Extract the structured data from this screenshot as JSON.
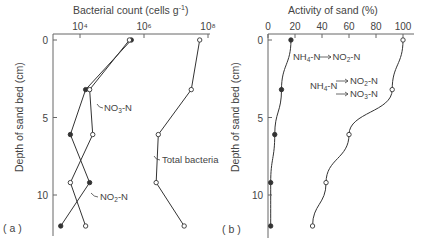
{
  "chart_data": [
    {
      "panel": "(a)",
      "type": "line",
      "title": "",
      "xlabel": "Bacterial count (cells g⁻¹)",
      "ylabel": "Depth of sand bed (cm)",
      "xscale": "log",
      "xlim": [
        3000,
        100000000
      ],
      "ylim": [
        0,
        12.5
      ],
      "y_inverted": true,
      "x_axis_position": "top",
      "x_ticks": [
        10000,
        1000000,
        100000000
      ],
      "x_tick_labels": [
        "10⁴",
        "10⁶",
        "10⁸"
      ],
      "y_ticks": [
        0,
        5,
        10
      ],
      "y_tick_labels": [
        "0",
        "5",
        "10"
      ],
      "grid": false,
      "legend": "inline labels",
      "depths": [
        0,
        3.2,
        6.1,
        9.2,
        12
      ],
      "series": [
        {
          "name": "NO₃-N",
          "marker": "filled",
          "values": [
            400000,
            15000,
            5000,
            20000,
            2500
          ]
        },
        {
          "name": "NO₂-N",
          "marker": "open",
          "values": [
            350000,
            20000,
            25000,
            5000,
            15000
          ]
        },
        {
          "name": "Total bacteria",
          "marker": "open",
          "values": [
            55000000,
            30000000,
            2800000,
            2400000,
            18000000
          ]
        }
      ],
      "annotations": [
        "NO₃-N",
        "NO₂-N",
        "Total bacteria"
      ]
    },
    {
      "panel": "(b)",
      "type": "line",
      "title": "",
      "xlabel": "Activity of sand (%)",
      "ylabel": "Depth of sand bed (cm)",
      "xlim": [
        0,
        105
      ],
      "ylim": [
        0,
        12.5
      ],
      "y_inverted": true,
      "x_axis_position": "top",
      "x_ticks": [
        0,
        20,
        40,
        60,
        80,
        100
      ],
      "x_tick_labels": [
        "0",
        "20",
        "40",
        "60",
        "80",
        "100"
      ],
      "y_ticks": [
        0,
        5,
        10
      ],
      "y_tick_labels": [
        "0",
        "5",
        "10"
      ],
      "grid": false,
      "legend": "inline labels",
      "depths": [
        0,
        3.2,
        6.1,
        9.2,
        12
      ],
      "series": [
        {
          "name": "NH₄-N → NO₂-N",
          "marker": "filled",
          "values": [
            17,
            10,
            5,
            2,
            2
          ]
        },
        {
          "name": "NH₄-N → NO₂-N → NO₃-N",
          "marker": "open",
          "values": [
            100,
            92,
            60,
            43,
            33
          ]
        }
      ],
      "annotations": [
        "NH₄-N → NO₂-N",
        "NH₄-N → NO₂-N / → NO₃-N"
      ]
    }
  ],
  "labels": {
    "a_title": "Bacterial count (cells g",
    "a_title_sup": "-1",
    "a_title_end": ")",
    "a_panel": "( a )",
    "b_title": "Activity of sand  (%)",
    "b_panel": "( b )",
    "ylabel": "Depth of sand bed (cm)",
    "a_ann_no3": "NO",
    "a_ann_no3_sub": "3",
    "a_ann_no3_end": "-N",
    "a_ann_no2": "NO",
    "a_ann_no2_sub": "2",
    "a_ann_no2_end": "-N",
    "a_ann_total": "Total bacteria",
    "b_ann1_a": "NH",
    "b_ann1_a_sub": "4",
    "b_ann1_b": "-N",
    "b_ann1_c": "NO",
    "b_ann1_c_sub": "2",
    "b_ann1_d": "-N",
    "b_ann2_a": "NH",
    "b_ann2_a_sub": "4",
    "b_ann2_b": "-N",
    "b_ann2_c": "NO",
    "b_ann2_c_sub": "2",
    "b_ann2_d": "-N",
    "b_ann2_e": "NO",
    "b_ann2_e_sub": "3",
    "b_ann2_f": "-N"
  },
  "colors": {
    "ink": "#333333",
    "text": "#444444",
    "background": "#ffffff"
  }
}
